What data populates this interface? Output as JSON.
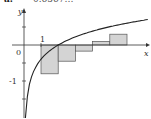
{
  "header": {
    "label": "a.",
    "value_partial": "0.6567…",
    "note": "clipped at top edge; digits not fully legible"
  },
  "chart_data": {
    "type": "bar",
    "subtype": "riemann-sum-with-curve",
    "title": "",
    "xlabel": "x",
    "ylabel": "y",
    "x_tick_labels": [
      "1"
    ],
    "y_tick_labels": [
      "-1"
    ],
    "origin_label": "0",
    "curve": "increasing concave log-like curve, y = ln-shaped, crossing y=0 near x≈1.9",
    "rectangles": [
      {
        "x_left": 1.0,
        "x_right": 2.0,
        "height": -0.8
      },
      {
        "x_left": 2.0,
        "x_right": 3.0,
        "height": -0.45
      },
      {
        "x_left": 3.0,
        "x_right": 4.0,
        "height": -0.17
      },
      {
        "x_left": 4.0,
        "x_right": 5.0,
        "height": 0.1
      },
      {
        "x_left": 5.0,
        "x_right": 6.0,
        "height": 0.3
      }
    ],
    "values_note": "rectangle heights estimated from pixel positions, not read from labels",
    "xlim": [
      -0.5,
      6.5
    ],
    "ylim": [
      -2.2,
      1.6
    ],
    "grid": false,
    "legend": null,
    "fill_color": "#d4d4d4",
    "line_color": "#222222"
  }
}
